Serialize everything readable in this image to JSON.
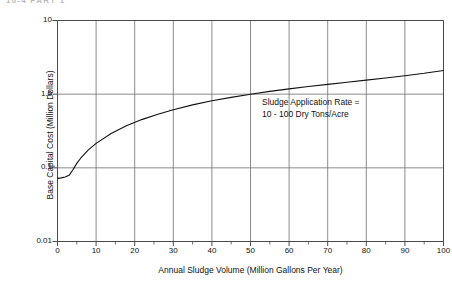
{
  "header_fragment": "10-4   PART 1",
  "chart_data": {
    "type": "line",
    "title": "",
    "xlabel": "Annual Sludge Volume (Million Gallons Per Year)",
    "ylabel": "Base Capital Cost (Million Dollars)",
    "xlim": [
      0,
      100
    ],
    "ylim": [
      0.01,
      10
    ],
    "yscale": "log",
    "xscale": "linear",
    "grid": true,
    "legend": "none",
    "xticks": [
      0,
      10,
      20,
      30,
      40,
      50,
      60,
      70,
      80,
      90,
      100
    ],
    "xtick_labels": [
      "0",
      "10",
      "20",
      "30",
      "40",
      "50",
      "60",
      "70",
      "80",
      "90",
      "100"
    ],
    "xminor_ticks": [
      5,
      15,
      25,
      35,
      45,
      55,
      65,
      75,
      85,
      95
    ],
    "yticks": [
      0.01,
      0.1,
      1.0,
      10
    ],
    "ytick_labels": [
      "0.01",
      "0.1",
      "1.0",
      "10"
    ],
    "gridlines_y": [
      0.1,
      1.0
    ],
    "annotations": [
      {
        "line1": "Sludge Application Rate =",
        "line2": "10 - 100 Dry Tons/Acre",
        "x": 18,
        "y": 1.4
      }
    ],
    "series": [
      {
        "name": "Base Capital Cost",
        "x": [
          0,
          1,
          2,
          3,
          4,
          5,
          6,
          8,
          10,
          14,
          18,
          22,
          26,
          30,
          35,
          40,
          45,
          50,
          55,
          60,
          65,
          70,
          75,
          80,
          85,
          90,
          95,
          100
        ],
        "values": [
          0.072,
          0.073,
          0.075,
          0.079,
          0.094,
          0.115,
          0.135,
          0.175,
          0.215,
          0.295,
          0.375,
          0.455,
          0.535,
          0.615,
          0.715,
          0.815,
          0.905,
          1.0,
          1.09,
          1.18,
          1.27,
          1.36,
          1.45,
          1.55,
          1.66,
          1.78,
          1.92,
          2.1
        ]
      }
    ]
  },
  "colors": {
    "axis": "#4a4a4a",
    "grid": "#6e6e6e",
    "curve": "#111111",
    "text": "#111111"
  }
}
